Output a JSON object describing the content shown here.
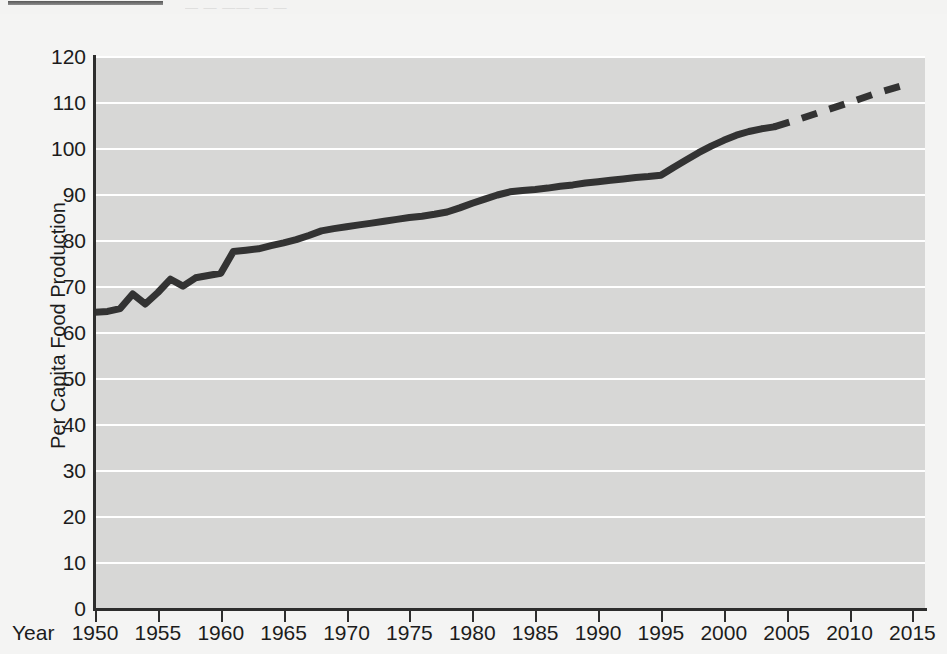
{
  "page": {
    "background_color": "#f3f3f2",
    "plot_background_color": "#d7d7d6",
    "gridline_color": "#ffffff",
    "line_color": "#333333",
    "axis_color": "#2d2d2d",
    "top_caption_ghost": "— —  —— —  —"
  },
  "chart_data": {
    "type": "line",
    "title": "",
    "xlabel": "Year",
    "ylabel": "Per Capita Food Production",
    "xlim": [
      1950,
      2016
    ],
    "ylim": [
      0,
      120
    ],
    "grid": "horizontal",
    "legend": "none",
    "yticks": [
      0,
      10,
      20,
      30,
      40,
      50,
      60,
      70,
      80,
      90,
      100,
      110,
      120
    ],
    "ytick_labels": [
      "0",
      "10",
      "20",
      "30",
      "40",
      "50",
      "60",
      "70",
      "80",
      "90",
      "100",
      "110",
      "120"
    ],
    "xticks": [
      1950,
      1955,
      1960,
      1965,
      1970,
      1975,
      1980,
      1985,
      1990,
      1995,
      2000,
      2005,
      2010,
      2015
    ],
    "xtick_labels": [
      "1950",
      "1955",
      "1960",
      "1965",
      "1970",
      "1975",
      "1980",
      "1985",
      "1990",
      "1995",
      "2000",
      "2005",
      "2010",
      "2015"
    ],
    "series": [
      {
        "name": "Per Capita Food Production (observed)",
        "style": "solid",
        "x": [
          1950,
          1951,
          1952,
          1953,
          1954,
          1955,
          1956,
          1957,
          1958,
          1959,
          1960,
          1961,
          1962,
          1963,
          1964,
          1965,
          1966,
          1967,
          1968,
          1969,
          1970,
          1971,
          1972,
          1973,
          1974,
          1975,
          1976,
          1977,
          1978,
          1979,
          1980,
          1981,
          1982,
          1983,
          1984,
          1985,
          1986,
          1987,
          1988,
          1989,
          1990,
          1991,
          1992,
          1993,
          1994,
          1995,
          1996,
          1997,
          1998,
          1999,
          2000,
          2001,
          2002,
          2003,
          2004
        ],
        "y": [
          64.5,
          64.7,
          65.3,
          68.5,
          66.3,
          68.8,
          71.7,
          70.2,
          72.0,
          72.5,
          73.0,
          77.7,
          78.0,
          78.3,
          79.0,
          79.6,
          80.3,
          81.2,
          82.2,
          82.7,
          83.1,
          83.5,
          83.9,
          84.3,
          84.7,
          85.1,
          85.4,
          85.8,
          86.3,
          87.2,
          88.2,
          89.1,
          90.0,
          90.7,
          91.0,
          91.2,
          91.5,
          91.9,
          92.2,
          92.6,
          92.9,
          93.2,
          93.5,
          93.8,
          94.0,
          94.3,
          96.0,
          97.6,
          99.2,
          100.6,
          101.9,
          103.0,
          103.8,
          104.4,
          104.8
        ]
      },
      {
        "name": "Per Capita Food Production (projected)",
        "style": "dashed",
        "x": [
          2004,
          2006,
          2008,
          2010,
          2012,
          2014.5
        ],
        "y": [
          104.8,
          106.5,
          108.3,
          110.1,
          112.0,
          114.0
        ]
      }
    ],
    "annotations": [
      {
        "text": "Solid line = observed data through 2004"
      },
      {
        "text": "Dashed line = projection to 2015"
      }
    ]
  }
}
